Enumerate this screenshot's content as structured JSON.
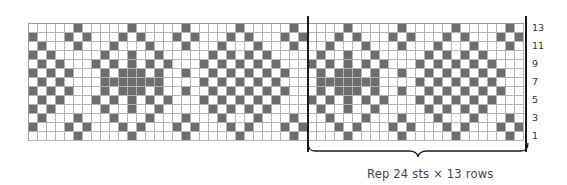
{
  "chart": {
    "stitches_shown": 55,
    "rows": 13,
    "repeat_width": 24,
    "repeat_start_col": 31,
    "left_offset_in_repeat": 17,
    "colors": {
      "contrast": "#6d6d6d",
      "background": "#ffffff",
      "gridline": "#b4b4b4",
      "repeat_line": "#1a1a1a"
    },
    "repeat_rows_top_to_bottom": [
      "000010000010000010000010",
      "000101000101000101000101",
      "001000100010001000100010",
      "010010010000010101010000",
      "101010101000101010101000",
      "010111010010010101010100",
      "011111110000101010101000",
      "010111010010010101010100",
      "101010101000101010101000",
      "010010010000010101010000",
      "001000100010001000100010",
      "000101000101000101000101",
      "000010000010000010000010"
    ],
    "row_labels": [
      "13",
      "11",
      "9",
      "7",
      "5",
      "3",
      "1"
    ]
  },
  "caption": "Rep 24 sts × 13 rows"
}
